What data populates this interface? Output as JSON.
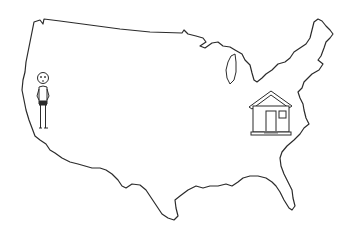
{
  "scene": {
    "description": "Line drawing of the contiguous United States map with a stick figure on the west coast and a house on the east coast",
    "background": "#ffffff",
    "stroke_color": "#2b2b2b",
    "house_fill": "#ffffff",
    "step_color": "#6e6e6e"
  },
  "figures": {
    "person": {
      "label": "person-west-coast"
    },
    "house": {
      "label": "house-east-coast"
    }
  }
}
